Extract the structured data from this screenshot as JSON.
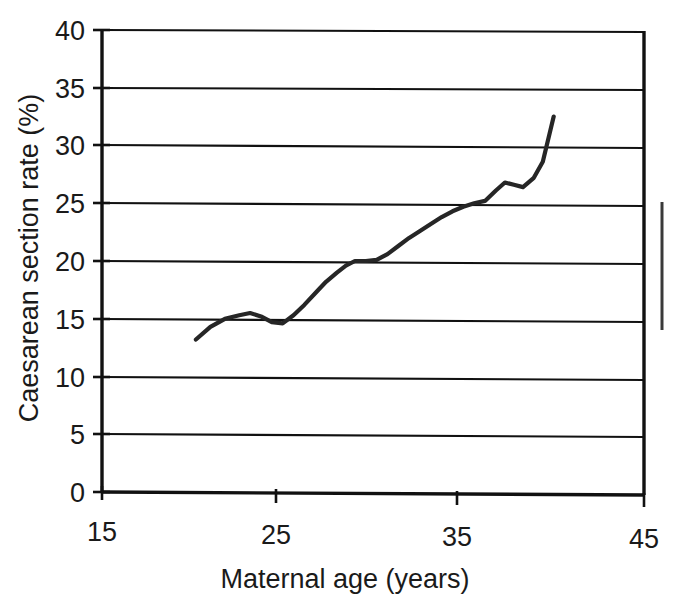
{
  "chart_data": {
    "type": "line",
    "title": "",
    "xlabel": "Maternal age (years)",
    "ylabel": "Caesarean section rate (%)",
    "xlim": [
      15,
      45
    ],
    "ylim": [
      0,
      40
    ],
    "xticks": [
      "15",
      "25",
      "35",
      "45"
    ],
    "yticks": [
      "0",
      "5",
      "10",
      "15",
      "20",
      "25",
      "30",
      "35",
      "40"
    ],
    "grid": "horizontal",
    "legend": "none",
    "series": [
      {
        "name": "Caesarean section rate",
        "x": [
          20.2,
          21.0,
          21.8,
          22.6,
          23.2,
          23.8,
          24.4,
          25.0,
          25.6,
          26.2,
          26.8,
          27.4,
          28.0,
          28.5,
          29.0,
          29.6,
          30.2,
          30.8,
          31.4,
          32.0,
          32.6,
          33.2,
          33.8,
          34.4,
          35.0,
          35.6,
          36.2,
          36.8,
          37.3,
          37.8,
          38.3,
          38.9,
          39.4,
          40.0
        ],
        "y": [
          13.2,
          14.3,
          15.0,
          15.3,
          15.5,
          15.2,
          14.7,
          14.6,
          15.3,
          16.2,
          17.2,
          18.2,
          19.0,
          19.6,
          20.0,
          20.0,
          20.1,
          20.6,
          21.3,
          22.0,
          22.6,
          23.2,
          23.8,
          24.3,
          24.7,
          25.0,
          25.2,
          26.1,
          26.8,
          26.6,
          26.4,
          27.2,
          28.6,
          32.5
        ]
      }
    ]
  },
  "axis_labels": {
    "y_title": "Caesarean section rate (%)",
    "x_title": "Maternal age (years)"
  },
  "ticks": {
    "y": [
      "40",
      "35",
      "30",
      "25",
      "20",
      "15",
      "10",
      "5",
      "0"
    ],
    "x": [
      "15",
      "25",
      "35",
      "45"
    ]
  },
  "colors": {
    "line": "#262626",
    "axis": "#111111",
    "background": "#ffffff"
  }
}
